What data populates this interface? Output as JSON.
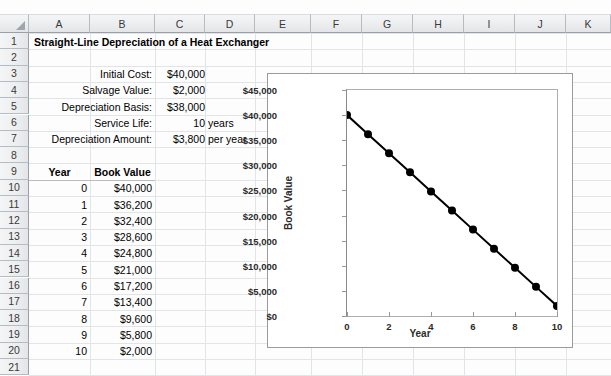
{
  "spreadsheet": {
    "columns": [
      "A",
      "B",
      "C",
      "D",
      "E",
      "F",
      "G",
      "H",
      "I",
      "J",
      "K"
    ],
    "rows": [
      "1",
      "2",
      "3",
      "4",
      "5",
      "6",
      "7",
      "8",
      "9",
      "10",
      "11",
      "12",
      "13",
      "14",
      "15",
      "16",
      "17",
      "18",
      "19",
      "20",
      "21"
    ],
    "title": "Straight-Line Depreciation of a Heat Exchanger",
    "inputs": [
      {
        "label": "Initial Cost:",
        "value": "$40,000",
        "unit": ""
      },
      {
        "label": "Salvage Value:",
        "value": "$2,000",
        "unit": ""
      },
      {
        "label": "Depreciation Basis:",
        "value": "$38,000",
        "unit": ""
      },
      {
        "label": "Service Life:",
        "value": "10",
        "unit": "years"
      },
      {
        "label": "Depreciation Amount:",
        "value": "$3,800",
        "unit": "per year"
      }
    ],
    "table": {
      "headers": [
        "Year",
        "Book Value"
      ],
      "rows": [
        [
          "0",
          "$40,000"
        ],
        [
          "1",
          "$36,200"
        ],
        [
          "2",
          "$32,400"
        ],
        [
          "3",
          "$28,600"
        ],
        [
          "4",
          "$24,800"
        ],
        [
          "5",
          "$21,000"
        ],
        [
          "6",
          "$17,200"
        ],
        [
          "7",
          "$13,400"
        ],
        [
          "8",
          "$9,600"
        ],
        [
          "9",
          "$5,800"
        ],
        [
          "10",
          "$2,000"
        ]
      ]
    }
  },
  "chart_data": {
    "type": "line",
    "title": "",
    "xlabel": "Year",
    "ylabel": "Book Value",
    "x": [
      0,
      1,
      2,
      3,
      4,
      5,
      6,
      7,
      8,
      9,
      10
    ],
    "values": [
      40000,
      36200,
      32400,
      28600,
      24800,
      21000,
      17200,
      13400,
      9600,
      5800,
      2000
    ],
    "series": [
      {
        "name": "Book Value",
        "values": [
          40000,
          36200,
          32400,
          28600,
          24800,
          21000,
          17200,
          13400,
          9600,
          5800,
          2000
        ]
      }
    ],
    "xlim": [
      0,
      10
    ],
    "ylim": [
      0,
      45000
    ],
    "xticks": [
      0,
      2,
      4,
      6,
      8,
      10
    ],
    "xticklabels": [
      "0",
      "2",
      "4",
      "6",
      "8",
      "10"
    ],
    "yticks": [
      0,
      5000,
      10000,
      15000,
      20000,
      25000,
      30000,
      35000,
      40000,
      45000
    ],
    "yticklabels": [
      "$0",
      "$5,000",
      "$10,000",
      "$15,000",
      "$20,000",
      "$25,000",
      "$30,000",
      "$35,000",
      "$40,000",
      "$45,000"
    ],
    "grid": false,
    "legend": false,
    "marker": "circle",
    "marker_color": "#000000",
    "line_color": "#000000"
  }
}
